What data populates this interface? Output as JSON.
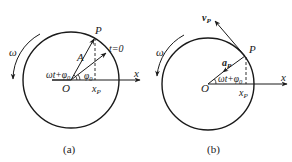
{
  "figure_a": {
    "caption": "(a)",
    "labels": {
      "omega": "ω",
      "P": "P",
      "A": "A",
      "t0": "t=0",
      "phase": "ωt+φ",
      "phase_sub": "0",
      "phi0": "φ",
      "phi0_sub": "0",
      "O": "O",
      "x": "x",
      "xP": "x",
      "xP_sub": "P"
    }
  },
  "figure_b": {
    "caption": "(b)",
    "labels": {
      "omega": "ω",
      "vP": "v",
      "vP_sub": "P",
      "P": "P",
      "aP": "a",
      "aP_sub": "P",
      "phase": "ωt+φ",
      "phase_sub": "0",
      "O": "O",
      "x": "x",
      "xP": "x",
      "xP_sub": "P"
    }
  },
  "colors": {
    "stroke": "#1a1a1a",
    "background": "#ffffff"
  }
}
